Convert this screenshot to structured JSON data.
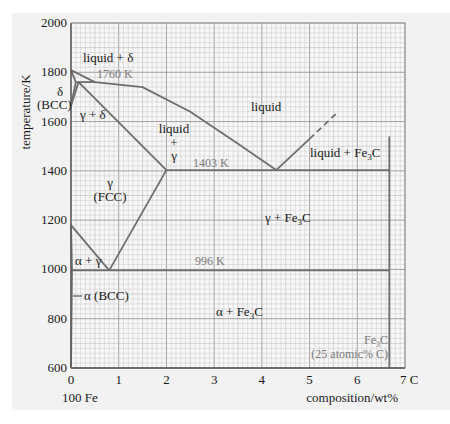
{
  "chart_data": {
    "type": "line",
    "title": "",
    "subtitle": "Iron–carbon phase diagram",
    "xlabel": "composition/wt%",
    "ylabel": "temperature/K",
    "xlim": [
      0,
      7
    ],
    "ylim": [
      600,
      2000
    ],
    "x_ticks": [
      0,
      1,
      2,
      3,
      4,
      5,
      6,
      7
    ],
    "x_tick_labels": [
      "0",
      "1",
      "2",
      "3",
      "4",
      "5",
      "6",
      "7 C"
    ],
    "y_ticks": [
      600,
      800,
      1000,
      1200,
      1400,
      1600,
      1800,
      2000
    ],
    "y_tick_labels": [
      "600",
      "800",
      "1000",
      "1200",
      "1400",
      "1600",
      "1800",
      "2000"
    ],
    "x_origin_label": "100 Fe",
    "grid": true,
    "series": [
      {
        "name": "liquidus (delta)",
        "points": [
          [
            0,
            1809
          ],
          [
            0.5,
            1760
          ]
        ]
      },
      {
        "name": "liquidus",
        "points": [
          [
            0.5,
            1760
          ],
          [
            1.5,
            1740
          ],
          [
            2.5,
            1640
          ],
          [
            3.5,
            1510
          ],
          [
            4.3,
            1403
          ]
        ]
      },
      {
        "name": "liquidus (Fe3C side)",
        "points": [
          [
            4.3,
            1403
          ],
          [
            5.0,
            1530
          ]
        ]
      },
      {
        "name": "liquidus (Fe3C side, extrapolated)",
        "style": "dashed",
        "points": [
          [
            5.0,
            1530
          ],
          [
            5.6,
            1640
          ]
        ]
      },
      {
        "name": "delta solidus",
        "points": [
          [
            0,
            1809
          ],
          [
            0.1,
            1760
          ]
        ]
      },
      {
        "name": "peritectic line",
        "value_K": 1760,
        "points": [
          [
            0.1,
            1760
          ],
          [
            0.5,
            1760
          ]
        ]
      },
      {
        "name": "gamma solidus",
        "points": [
          [
            0.16,
            1760
          ],
          [
            2.0,
            1403
          ]
        ]
      },
      {
        "name": "delta/gamma boundary",
        "points": [
          [
            0,
            1665
          ],
          [
            0.1,
            1760
          ]
        ]
      },
      {
        "name": "delta/gamma boundary 2",
        "points": [
          [
            0,
            1665
          ],
          [
            0.16,
            1760
          ]
        ]
      },
      {
        "name": "eutectic line",
        "value_K": 1403,
        "points": [
          [
            2.0,
            1403
          ],
          [
            6.67,
            1403
          ]
        ]
      },
      {
        "name": "Acm (gamma solvus)",
        "points": [
          [
            2.0,
            1403
          ],
          [
            0.8,
            996
          ]
        ]
      },
      {
        "name": "A3 (gamma/alpha)",
        "points": [
          [
            0,
            1180
          ],
          [
            0.8,
            996
          ]
        ]
      },
      {
        "name": "alpha solvus",
        "points": [
          [
            0,
            1180
          ],
          [
            0.02,
            996
          ],
          [
            0.0,
            600
          ]
        ]
      },
      {
        "name": "eutectoid line",
        "value_K": 996,
        "points": [
          [
            0.02,
            996
          ],
          [
            6.67,
            996
          ]
        ]
      },
      {
        "name": "Fe3C composition",
        "points": [
          [
            6.67,
            600
          ],
          [
            6.67,
            1540
          ]
        ]
      }
    ],
    "annotations": [
      {
        "text": "liquid + δ",
        "x": 0.35,
        "y": 1830
      },
      {
        "text": "1760 K",
        "x": 0.6,
        "y": 1765,
        "color": "#7a7a7a"
      },
      {
        "text": "δ (BCC)",
        "x": -0.3,
        "y": 1690
      },
      {
        "text": "γ + δ",
        "x": 0.25,
        "y": 1625
      },
      {
        "text": "liquid",
        "x": 3.8,
        "y": 1690
      },
      {
        "text": "liquid + γ",
        "x": 1.8,
        "y": 1520
      },
      {
        "text": "1403 K",
        "x": 2.4,
        "y": 1415,
        "color": "#7a7a7a"
      },
      {
        "text": "liquid + Fe3C",
        "x": 5.2,
        "y": 1440
      },
      {
        "text": "γ (FCC)",
        "x": 0.9,
        "y": 1330
      },
      {
        "text": "γ + Fe3C",
        "x": 3.2,
        "y": 1200
      },
      {
        "text": "α + γ",
        "x": 0.1,
        "y": 1040
      },
      {
        "text": "996 K",
        "x": 2.1,
        "y": 1010,
        "color": "#7a7a7a"
      },
      {
        "text": "α (BCC)",
        "x": 0.2,
        "y": 920
      },
      {
        "text": "α + Fe3C",
        "x": 2.1,
        "y": 835
      },
      {
        "text": "Fe3C (25 atomic% C)",
        "x": 6.0,
        "y": 650,
        "color": "#7a7a7a"
      }
    ]
  },
  "labels": {
    "ylabel": "temperature/K",
    "xlabel": "composition/wt%",
    "origin": "100 Fe",
    "x_end": "7 C",
    "liquid_delta": "liquid + δ",
    "k1760": "1760 K",
    "delta": "δ",
    "bcc_delta": "(BCC)",
    "gamma_delta": "γ + δ",
    "liquid": "liquid",
    "liquid_gamma_1": "liquid",
    "liquid_gamma_2": "+",
    "liquid_gamma_3": "γ",
    "k1403": "1403 K",
    "liquid_fe3c": "liquid + Fe",
    "gamma": "γ",
    "fcc": "(FCC)",
    "gamma_fe3c": "γ + Fe",
    "alpha_gamma": "α + γ",
    "k996": "996 K",
    "alpha_bcc": "α (BCC)",
    "alpha_fe3c": "α + Fe",
    "fe3c_a": "Fe",
    "fe3c_b": "(25 atomic% C)",
    "sub3": "3",
    "c": "C"
  },
  "colors": {
    "background": "#f2f2f2",
    "grid_minor": "#c8c8c8",
    "grid_major": "#9a9a9a",
    "curve": "#6e6e6e",
    "axis": "#333333",
    "text": "#1a1a1a",
    "annotation_grey": "#7a7a7a"
  }
}
